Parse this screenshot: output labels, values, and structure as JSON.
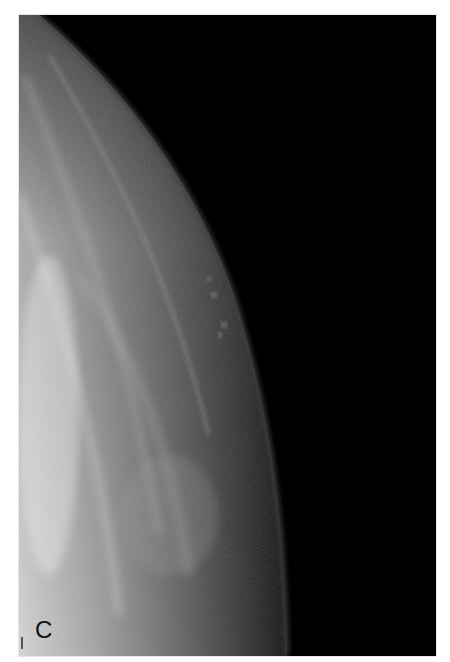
{
  "figure": {
    "panel_label": "C",
    "image_type": "mammogram",
    "colors": {
      "background": "#000000",
      "tissue_bright": "#d8d8d8",
      "tissue_mid": "#8a8a8a",
      "skin_line": "#3a3a3a",
      "calcification": "#6e6e6e"
    }
  }
}
